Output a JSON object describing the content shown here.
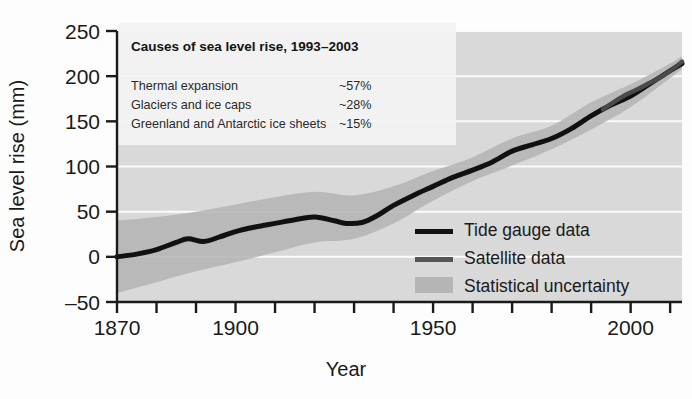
{
  "chart_data": {
    "type": "line",
    "title": "",
    "xlabel": "Year",
    "ylabel": "Sea level rise (mm)",
    "xlim": [
      1870,
      2013
    ],
    "ylim": [
      -50,
      250
    ],
    "xticks": [
      1870,
      1880,
      1890,
      1900,
      1910,
      1920,
      1930,
      1940,
      1950,
      1960,
      1970,
      1980,
      1990,
      2000,
      2010
    ],
    "xtick_labels": [
      "1870",
      "",
      "",
      "1900",
      "",
      "",
      "",
      "",
      "1950",
      "",
      "",
      "",
      "",
      "2000",
      ""
    ],
    "yticks": [
      -50,
      0,
      50,
      100,
      150,
      200,
      250
    ],
    "ytick_labels": [
      "–50",
      "0",
      "50",
      "100",
      "150",
      "200",
      "250"
    ],
    "grid": "horizontal-white",
    "legend_position": "bottom-right",
    "series": [
      {
        "name": "Tide gauge data",
        "style": "line",
        "color": "#111111",
        "x": [
          1870,
          1875,
          1880,
          1885,
          1888,
          1892,
          1896,
          1900,
          1905,
          1910,
          1915,
          1920,
          1925,
          1928,
          1932,
          1936,
          1940,
          1945,
          1950,
          1955,
          1960,
          1965,
          1970,
          1975,
          1980,
          1985,
          1990,
          1995,
          2000,
          2005,
          2010,
          2013
        ],
        "y": [
          0,
          3,
          8,
          16,
          20,
          17,
          22,
          28,
          33,
          37,
          41,
          44,
          40,
          37,
          38,
          46,
          57,
          68,
          78,
          88,
          96,
          105,
          117,
          124,
          131,
          142,
          156,
          168,
          178,
          192,
          206,
          214
        ]
      },
      {
        "name": "Satellite data",
        "style": "line",
        "color": "#4a4a4a",
        "x": [
          1993,
          1996,
          1999,
          2002,
          2005,
          2008,
          2011,
          2013
        ],
        "y": [
          163,
          172,
          180,
          186,
          193,
          200,
          209,
          216
        ]
      },
      {
        "name": "Statistical uncertainty",
        "style": "band",
        "color": "#b0b0b0",
        "x": [
          1870,
          1880,
          1890,
          1900,
          1910,
          1920,
          1930,
          1940,
          1950,
          1960,
          1970,
          1980,
          1990,
          2000,
          2010,
          2013
        ],
        "y_lower": [
          -40,
          -28,
          -16,
          -6,
          5,
          16,
          20,
          37,
          62,
          84,
          101,
          119,
          141,
          166,
          198,
          208
        ],
        "y_upper": [
          40,
          44,
          50,
          58,
          66,
          72,
          68,
          78,
          95,
          110,
          131,
          145,
          171,
          191,
          214,
          222
        ]
      }
    ],
    "annotation_box": {
      "title": "Causes of sea level rise, 1993–2003",
      "rows": [
        {
          "label": "Thermal expansion",
          "value": "~57%"
        },
        {
          "label": "Glaciers and ice caps",
          "value": "~28%"
        },
        {
          "label": "Greenland and Antarctic ice sheets",
          "value": "~15%"
        }
      ]
    },
    "legend_entries": [
      {
        "label": "Tide gauge data",
        "swatch": "line",
        "color": "#111111"
      },
      {
        "label": "Satellite data",
        "swatch": "line",
        "color": "#555555"
      },
      {
        "label": "Statistical uncertainty",
        "swatch": "square",
        "color": "#b5b5b5"
      }
    ],
    "colors": {
      "plot_background": "#d9d9d9",
      "gridline": "#fbfbfb",
      "band": "#b3b3b3",
      "tide_gauge": "#111111",
      "satellite": "#4a4a4a",
      "annotation_background": "#f2f2f2",
      "axis": "#1a1a1a"
    }
  }
}
